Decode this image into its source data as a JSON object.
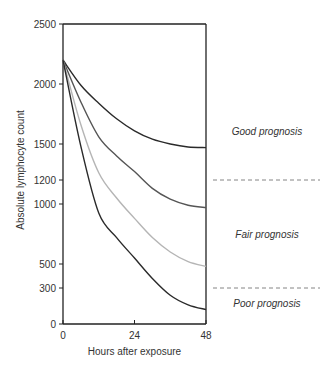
{
  "chart_data": {
    "type": "line",
    "title": "",
    "xlabel": "Hours after exposure",
    "ylabel": "Absolute lymphocyte count",
    "xlim": [
      0,
      48
    ],
    "ylim": [
      0,
      2500
    ],
    "x_ticks": [
      0,
      24,
      48
    ],
    "y_ticks": [
      0,
      300,
      500,
      1000,
      1200,
      1500,
      2000,
      2500
    ],
    "grid": false,
    "legend": null,
    "x": [
      0,
      6,
      12,
      18,
      24,
      30,
      36,
      42,
      48
    ],
    "series": [
      {
        "name": "Curve 1",
        "color": "#2a2a2a",
        "values": [
          2200,
          1990,
          1840,
          1710,
          1610,
          1540,
          1500,
          1475,
          1470
        ]
      },
      {
        "name": "Curve 2",
        "color": "#555555",
        "values": [
          2200,
          1850,
          1560,
          1400,
          1270,
          1130,
          1040,
          990,
          970
        ]
      },
      {
        "name": "Curve 3",
        "color": "#b5b5b5",
        "values": [
          2200,
          1660,
          1260,
          1050,
          880,
          720,
          600,
          520,
          480
        ]
      },
      {
        "name": "Curve 4",
        "color": "#2a2a2a",
        "values": [
          2200,
          1480,
          925,
          720,
          550,
          380,
          240,
          160,
          120
        ]
      }
    ],
    "reference_lines": [
      {
        "y": 1200,
        "style": "dashed",
        "label_above": "Good prognosis",
        "label_below": "Fair prognosis"
      },
      {
        "y": 300,
        "style": "dashed",
        "label_below": "Poor prognosis"
      }
    ],
    "annotations": [
      {
        "text": "Good prognosis",
        "region": "above 1200"
      },
      {
        "text": "Fair prognosis",
        "region": "300–1200"
      },
      {
        "text": "Poor prognosis",
        "region": "below 300"
      }
    ]
  },
  "labels": {
    "xlabel": "Hours after exposure",
    "ylabel": "Absolute lymphocyte count",
    "y_ticks": [
      "0",
      "300",
      "500",
      "1000",
      "1200",
      "1500",
      "2000",
      "2500"
    ],
    "x_ticks": [
      "0",
      "24",
      "48"
    ],
    "zones": [
      "Good prognosis",
      "Fair prognosis",
      "Poor prognosis"
    ]
  }
}
